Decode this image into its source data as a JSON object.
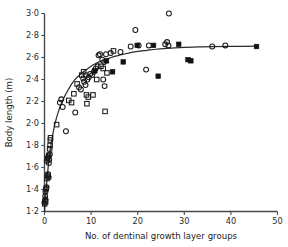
{
  "chart_data": {
    "type": "scatter",
    "title": "",
    "xlabel": "No. of dentinal growth layer groups",
    "ylabel": "Body length (m)",
    "xlim": [
      0,
      50
    ],
    "ylim": [
      1.2,
      3.0
    ],
    "xticks": [
      0,
      10,
      20,
      30,
      40,
      50
    ],
    "xticklabels": [
      "0",
      "10",
      "20",
      "30",
      "40",
      "50"
    ],
    "yticks": [
      1.2,
      1.4,
      1.6,
      1.8,
      2.0,
      2.2,
      2.4,
      2.6,
      2.8,
      3.0
    ],
    "yticklabels": [
      "1·2",
      "1·4",
      "1·6",
      "1·8",
      "2·0",
      "2·2",
      "2·4",
      "2·6",
      "2·8",
      "3·0"
    ],
    "grid": false,
    "legend": "none",
    "axis_style": "left-and-bottom-spines",
    "colors": {
      "marker_stroke": "#1a1a1a",
      "filled_marker": "#111111",
      "curve": "#2b2b2b",
      "axis": "#4a4a4a",
      "background": "#ffffff"
    },
    "series": [
      {
        "name": "open-circle",
        "marker": "open-circle",
        "points": [
          [
            0.0,
            1.28
          ],
          [
            0.1,
            1.3
          ],
          [
            0.2,
            1.31
          ],
          [
            0.15,
            1.34
          ],
          [
            0.3,
            1.4
          ],
          [
            0.45,
            1.42
          ],
          [
            0.2,
            1.38
          ],
          [
            0.6,
            1.52
          ],
          [
            0.75,
            1.54
          ],
          [
            0.9,
            1.51
          ],
          [
            0.5,
            1.66
          ],
          [
            0.7,
            1.69
          ],
          [
            0.85,
            1.7
          ],
          [
            1.0,
            1.67
          ],
          [
            1.15,
            1.72
          ],
          [
            0.95,
            1.64
          ],
          [
            3.3,
            2.19
          ],
          [
            3.6,
            2.22
          ],
          [
            3.9,
            2.15
          ],
          [
            4.6,
            1.93
          ],
          [
            6.6,
            2.1
          ],
          [
            7.4,
            2.33
          ],
          [
            7.8,
            2.31
          ],
          [
            8.3,
            2.41
          ],
          [
            8.5,
            2.38
          ],
          [
            8.8,
            2.35
          ],
          [
            8.9,
            2.44
          ],
          [
            9.2,
            2.4
          ],
          [
            9.5,
            2.42
          ],
          [
            9.8,
            2.45
          ],
          [
            10.2,
            2.44
          ],
          [
            10.6,
            2.47
          ],
          [
            11.0,
            2.5
          ],
          [
            11.4,
            2.52
          ],
          [
            11.6,
            2.62
          ],
          [
            11.9,
            2.63
          ],
          [
            12.4,
            2.58
          ],
          [
            12.8,
            2.56
          ],
          [
            13.2,
            2.63
          ],
          [
            14.2,
            2.64
          ],
          [
            16.3,
            2.65
          ],
          [
            12.6,
            2.4
          ],
          [
            12.9,
            2.34
          ],
          [
            18.5,
            2.7
          ],
          [
            19.5,
            2.85
          ],
          [
            21.8,
            2.49
          ],
          [
            22.4,
            2.71
          ],
          [
            25.9,
            2.72
          ],
          [
            26.3,
            2.74
          ],
          [
            26.6,
            2.71
          ],
          [
            26.7,
            3.0
          ],
          [
            36.0,
            2.7
          ],
          [
            38.8,
            2.71
          ],
          [
            20.2,
            2.71
          ]
        ]
      },
      {
        "name": "open-square",
        "marker": "open-square",
        "points": [
          [
            0.05,
            1.27
          ],
          [
            0.25,
            1.29
          ],
          [
            0.35,
            1.41
          ],
          [
            0.55,
            1.5
          ],
          [
            0.8,
            1.53
          ],
          [
            0.65,
            1.68
          ],
          [
            0.9,
            1.71
          ],
          [
            1.2,
            1.8
          ],
          [
            1.25,
            1.85
          ],
          [
            1.3,
            1.87
          ],
          [
            2.6,
            1.99
          ],
          [
            5.2,
            2.21
          ],
          [
            5.8,
            2.19
          ],
          [
            6.3,
            2.27
          ],
          [
            7.0,
            2.36
          ],
          [
            8.0,
            2.44
          ],
          [
            8.4,
            2.47
          ],
          [
            9.0,
            2.26
          ],
          [
            9.4,
            2.24
          ],
          [
            9.1,
            2.18
          ],
          [
            10.4,
            2.26
          ],
          [
            11.2,
            2.4
          ],
          [
            12.1,
            2.52
          ],
          [
            12.6,
            2.5
          ],
          [
            13.4,
            2.46
          ],
          [
            13.0,
            2.11
          ],
          [
            14.8,
            2.66
          ],
          [
            1.1,
            1.77
          ]
        ]
      },
      {
        "name": "filled-square",
        "marker": "filled-square",
        "points": [
          [
            10.8,
            2.48
          ],
          [
            13.3,
            2.57
          ],
          [
            14.6,
            2.47
          ],
          [
            16.9,
            2.56
          ],
          [
            19.9,
            2.71
          ],
          [
            23.4,
            2.71
          ],
          [
            24.4,
            2.43
          ],
          [
            28.8,
            2.72
          ],
          [
            30.8,
            2.58
          ],
          [
            31.4,
            2.57
          ],
          [
            45.5,
            2.7
          ]
        ]
      }
    ],
    "fit_curve": {
      "name": "growth-curve",
      "model": "von-Bertalanffy",
      "description": "Monotonic saturating growth curve fitted through the data",
      "points": [
        [
          0.0,
          1.2
        ],
        [
          0.5,
          1.47
        ],
        [
          1.0,
          1.69
        ],
        [
          1.5,
          1.83
        ],
        [
          2.0,
          1.95
        ],
        [
          2.5,
          2.04
        ],
        [
          3.0,
          2.11
        ],
        [
          3.5,
          2.17
        ],
        [
          4.0,
          2.22
        ],
        [
          5.0,
          2.3
        ],
        [
          6.0,
          2.37
        ],
        [
          7.0,
          2.42
        ],
        [
          8.0,
          2.46
        ],
        [
          9.0,
          2.49
        ],
        [
          10.0,
          2.52
        ],
        [
          11.0,
          2.545
        ],
        [
          12.0,
          2.565
        ],
        [
          13.0,
          2.58
        ],
        [
          14.0,
          2.595
        ],
        [
          15.0,
          2.61
        ],
        [
          16.0,
          2.62
        ],
        [
          18.0,
          2.64
        ],
        [
          20.0,
          2.655
        ],
        [
          22.0,
          2.665
        ],
        [
          24.0,
          2.675
        ],
        [
          26.0,
          2.682
        ],
        [
          28.0,
          2.688
        ],
        [
          30.0,
          2.692
        ],
        [
          33.0,
          2.696
        ],
        [
          36.0,
          2.699
        ],
        [
          40.0,
          2.701
        ],
        [
          45.5,
          2.703
        ]
      ]
    }
  }
}
